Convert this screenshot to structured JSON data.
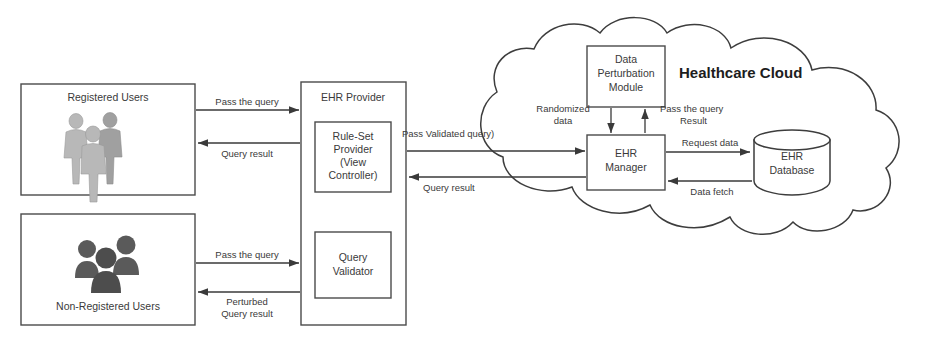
{
  "diagram": {
    "cloud_label": "Healthcare Cloud",
    "nodes": {
      "registered_users": "Registered Users",
      "non_registered_users": "Non-Registered Users",
      "ehr_provider": "EHR Provider",
      "rule_set_provider_l1": "Rule-Set",
      "rule_set_provider_l2": "Provider",
      "rule_set_provider_l3": "(View",
      "rule_set_provider_l4": "Controller)",
      "query_validator_l1": "Query",
      "query_validator_l2": "Validator",
      "data_perturbation_l1": "Data",
      "data_perturbation_l2": "Perturbation",
      "data_perturbation_l3": "Module",
      "ehr_manager_l1": "EHR",
      "ehr_manager_l2": "Manager",
      "ehr_database_l1": "EHR",
      "ehr_database_l2": "Database"
    },
    "edges": {
      "reg_pass_query": "Pass the query",
      "reg_query_result": "Query result",
      "nonreg_pass_query": "Pass the query",
      "nonreg_perturbed_l1": "Perturbed",
      "nonreg_perturbed_l2": "Query result",
      "pass_validated_query": "Pass Validated query)",
      "provider_query_result": "Query result",
      "randomized_data_l1": "Randomized",
      "randomized_data_l2": "data",
      "pass_query_result_l1": "Pass the query",
      "pass_query_result_l2": "Result",
      "request_data": "Request data",
      "data_fetch": "Data fetch"
    },
    "icons": {
      "registered_users_icon": "group-of-people-3d-icon",
      "non_registered_users_icon": "group-of-people-silhouette-icon",
      "database_icon": "cylinder-database-icon",
      "cloud_icon": "cloud-outline-icon"
    },
    "colors": {
      "stroke": "#3d3d3d",
      "box_fill": "#ffffff",
      "text": "#3a3a3a",
      "cloud_title": "#1d1d1d",
      "grey_figures": "#b8b8b8",
      "dark_figures": "#4d4d4d"
    }
  }
}
